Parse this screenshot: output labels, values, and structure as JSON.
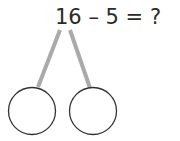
{
  "problem": {
    "equation": "16 – 5 = ?",
    "minuend": "16",
    "subtrahend": "5",
    "result_placeholder": "?"
  },
  "number_bond": {
    "parts": [
      {
        "label": "",
        "position": "left"
      },
      {
        "label": "",
        "position": "right"
      }
    ],
    "line_color": "#aaaaaa",
    "circle_stroke": "#333333"
  }
}
